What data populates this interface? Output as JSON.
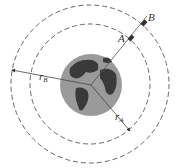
{
  "diagram": {
    "type": "orbit-diagram",
    "labels": {
      "point_a": "A",
      "point_b": "B",
      "radius_a": "r",
      "radius_a_sub": "A",
      "radius_b": "r",
      "radius_b_sub": "B"
    },
    "elements": {
      "earth": "earth-globe",
      "inner_orbit": "dashed-circle-radius-rA",
      "outer_orbit": "dashed-circle-radius-rB"
    },
    "colors": {
      "line": "#444444",
      "ocean": "#9a9a9a",
      "land": "#3a3a3a",
      "background": "#ffffff"
    }
  }
}
